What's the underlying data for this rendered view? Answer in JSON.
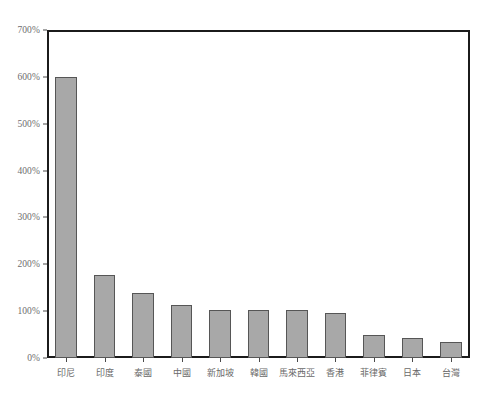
{
  "chart_data": {
    "type": "bar",
    "title": "",
    "subtitle": "",
    "xlabel": "",
    "ylabel": "",
    "ylim": [
      0,
      700
    ],
    "y_tick_step": 100,
    "y_tick_labels": [
      "0%",
      "100%",
      "200%",
      "300%",
      "400%",
      "500%",
      "600%",
      "700%"
    ],
    "y_tick_values": [
      0,
      100,
      200,
      300,
      400,
      500,
      600,
      700
    ],
    "grid": false,
    "legend": false,
    "legend_position": "none",
    "value_unit": "%",
    "categories": [
      "印尼",
      "印度",
      "泰國",
      "中國",
      "新加坡",
      "韓國",
      "馬來西亞",
      "香港",
      "菲律賓",
      "日本",
      "台灣"
    ],
    "values": [
      600,
      177,
      138,
      113,
      103,
      103,
      102,
      95,
      50,
      43,
      34
    ],
    "series": [
      {
        "name": "",
        "values": [
          600,
          177,
          138,
          113,
          103,
          103,
          102,
          95,
          50,
          43,
          34
        ]
      }
    ],
    "colors": {
      "bar_fill": "#a8a8a8",
      "bar_border": "#565656",
      "axis": "#1b1b1b",
      "tick_label": "#6e6e6e",
      "plot_background": "#ffffff",
      "figure_background": "#ffffff"
    }
  }
}
